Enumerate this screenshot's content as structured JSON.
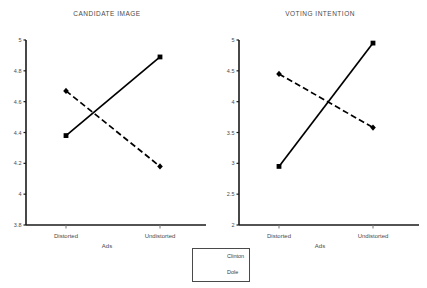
{
  "chart_data": [
    {
      "type": "line",
      "title": "CANDIDATE IMAGE",
      "xlabel": "Ads",
      "ylabel": "",
      "categories": [
        "Distorted",
        "Undistorted"
      ],
      "ylim": [
        3.8,
        5
      ],
      "yticks": [
        "3.8",
        "4",
        "4.2",
        "4.4",
        "4.6",
        "4.8",
        "5"
      ],
      "ytick_values": [
        3.8,
        4.0,
        4.2,
        4.4,
        4.6,
        4.8,
        5.0
      ],
      "grid": false,
      "legend_position": "bottom-center",
      "series": [
        {
          "name": "Clinton",
          "values": [
            4.38,
            4.89
          ],
          "style": "solid",
          "marker": "square",
          "color": "#000000"
        },
        {
          "name": "Dole",
          "values": [
            4.67,
            4.18
          ],
          "style": "dashed",
          "marker": "diamond",
          "color": "#000000"
        }
      ]
    },
    {
      "type": "line",
      "title": "VOTING INTENTION",
      "xlabel": "Ads",
      "ylabel": "",
      "categories": [
        "Distorted",
        "Undistorted"
      ],
      "ylim": [
        2,
        5
      ],
      "yticks": [
        "2",
        "2.5",
        "3",
        "3.5",
        "4",
        "4.5",
        "5"
      ],
      "ytick_values": [
        2.0,
        2.5,
        3.0,
        3.5,
        4.0,
        4.5,
        5.0
      ],
      "grid": false,
      "legend_position": "bottom-center",
      "series": [
        {
          "name": "Clinton",
          "values": [
            2.95,
            4.95
          ],
          "style": "solid",
          "marker": "square",
          "color": "#000000"
        },
        {
          "name": "Dole",
          "values": [
            4.45,
            3.58
          ],
          "style": "dashed",
          "marker": "diamond",
          "color": "#000000"
        }
      ]
    }
  ],
  "legend": {
    "entries": [
      {
        "label": "Clinton",
        "style": "solid"
      },
      {
        "label": "Dole",
        "style": "dashed"
      }
    ]
  },
  "colors": {
    "axis": "#1a1a1a",
    "series": "#000000",
    "text": "#4a4a4a",
    "background": "#ffffff"
  }
}
